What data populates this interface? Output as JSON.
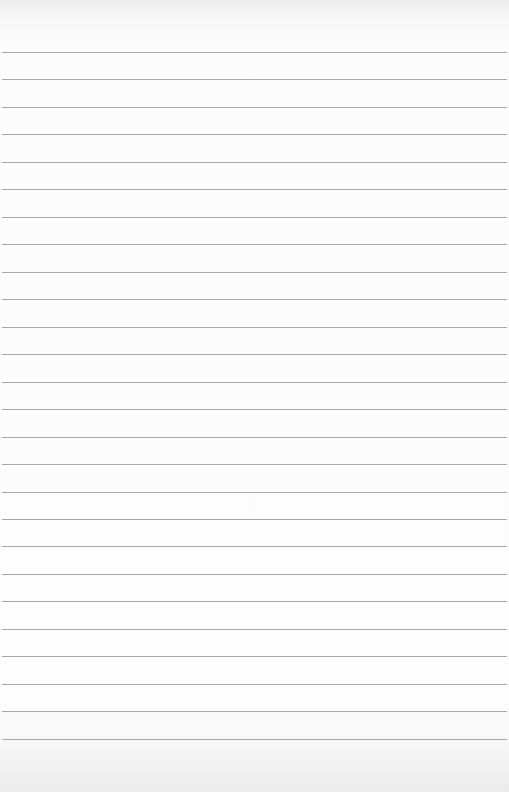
{
  "page": {
    "type": "lined-paper",
    "background_color": "#fcfcfc",
    "rule_color": "#a3a3a3",
    "rule_count": 26,
    "first_rule_y": 52,
    "rule_spacing": 27.47
  }
}
